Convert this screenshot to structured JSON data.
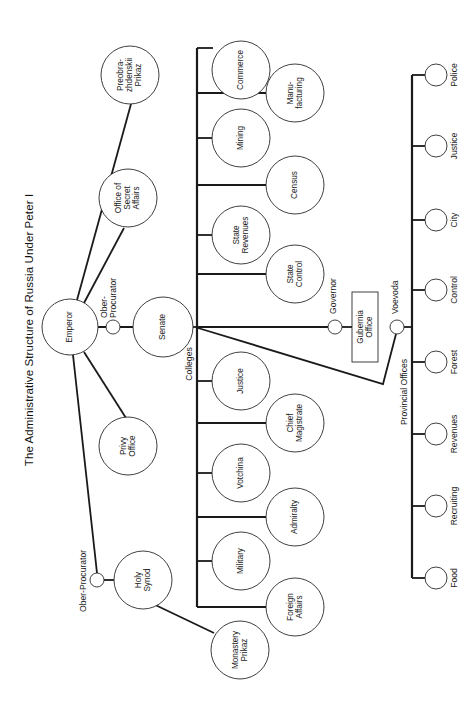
{
  "title": "The Administrative Structure of Russia Under Peter I",
  "colors": {
    "line": "#1a1a1a",
    "background": "#ffffff"
  },
  "orientation": "rotated 90 degrees counter-clockwise (text reads bottom to top)",
  "top": {
    "emperor": "Emperor",
    "ober_procurator_senate": [
      "Ober-",
      "Procurator"
    ],
    "senate": "Senate",
    "privy_office": [
      "Privy",
      "Office"
    ],
    "secret_affairs": [
      "Office of",
      "Secret",
      "Affairs"
    ],
    "preobrazhenskii": [
      "Preobra-",
      "zhdenskii",
      "Prikaz"
    ],
    "holy_synod": [
      "Holy",
      "Synod"
    ],
    "ober_procurator_synod": "Ober-Procurator",
    "monastery_prikaz": [
      "Monastery",
      "Prikaz"
    ]
  },
  "colleges": {
    "label": "Colleges",
    "items": [
      {
        "name": [
          "Commerce"
        ]
      },
      {
        "name": [
          "Manu-",
          "facturing"
        ]
      },
      {
        "name": [
          "Mining"
        ]
      },
      {
        "name": [
          "Census"
        ]
      },
      {
        "name": [
          "State",
          "Revenues"
        ]
      },
      {
        "name": [
          "State",
          "Control"
        ]
      },
      {
        "name": [
          "Justice"
        ]
      },
      {
        "name": [
          "Chief",
          "Magistrate"
        ]
      },
      {
        "name": [
          "Votchina"
        ]
      },
      {
        "name": [
          "Admiralty"
        ]
      },
      {
        "name": [
          "Military"
        ]
      },
      {
        "name": [
          "Foreign",
          "Affairs"
        ]
      }
    ]
  },
  "provincial": {
    "governor": "Governor",
    "gubernia_office": [
      "Gubernia",
      "Office"
    ],
    "voevoda": "Voevoda",
    "label": "Provincial Offices",
    "items": [
      "Police",
      "Justice",
      "City",
      "Control",
      "Forest",
      "Revenues",
      "Recruiting",
      "Food"
    ]
  }
}
